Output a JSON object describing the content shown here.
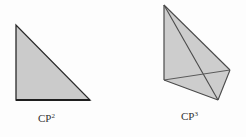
{
  "figure": {
    "left": {
      "label_base": "CP",
      "label_exp": "2",
      "shape": "triangle",
      "fill": "#cbcbcb",
      "stroke": "#2a2a2a"
    },
    "right": {
      "label_base": "CP",
      "label_exp": "3",
      "shape": "tetrahedron",
      "fill": "#cdcdcd",
      "stroke": "#4a4a4a"
    }
  }
}
